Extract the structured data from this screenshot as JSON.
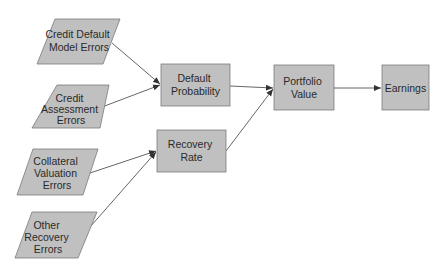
{
  "diagram": {
    "type": "flowchart",
    "colors": {
      "fill": "#c0c0c0",
      "stroke": "#7a7a7a",
      "edge": "#555555",
      "text": "#2a2a2a"
    },
    "nodes": [
      {
        "id": "cdme",
        "shape": "parallelogram",
        "lines": [
          "Credit Default",
          "Model Errors"
        ]
      },
      {
        "id": "cae",
        "shape": "parallelogram",
        "lines": [
          "Credit",
          "Assessment",
          "Errors"
        ]
      },
      {
        "id": "cve",
        "shape": "parallelogram",
        "lines": [
          "Collateral",
          "Valuation",
          "Errors"
        ]
      },
      {
        "id": "ore",
        "shape": "parallelogram",
        "lines": [
          "Other",
          "Recovery",
          "Errors"
        ]
      },
      {
        "id": "dp",
        "shape": "rect",
        "lines": [
          "Default",
          "Probability"
        ]
      },
      {
        "id": "rr",
        "shape": "rect",
        "lines": [
          "Recovery",
          "Rate"
        ]
      },
      {
        "id": "pv",
        "shape": "rect",
        "lines": [
          "Portfolio",
          "Value"
        ]
      },
      {
        "id": "earn",
        "shape": "rect",
        "lines": [
          "Earnings"
        ]
      }
    ],
    "edges": [
      {
        "from": "cdme",
        "to": "dp"
      },
      {
        "from": "cae",
        "to": "dp"
      },
      {
        "from": "cve",
        "to": "rr"
      },
      {
        "from": "ore",
        "to": "rr"
      },
      {
        "from": "dp",
        "to": "pv"
      },
      {
        "from": "rr",
        "to": "pv"
      },
      {
        "from": "pv",
        "to": "earn"
      }
    ]
  }
}
